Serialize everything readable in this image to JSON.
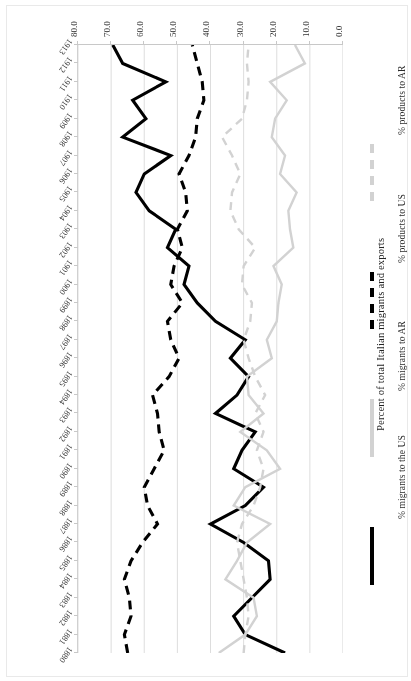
{
  "figure": {
    "rotation_note": "figure rendered upside-down in source screenshot",
    "background": "#ffffff"
  },
  "axes": {
    "value_axis_title": "Percent of total Italian migrants and exports",
    "value_ticks": [
      "0.0",
      "10.0",
      "20.0",
      "30.0",
      "40.0",
      "50.0",
      "60.0",
      "70.0",
      "80.0"
    ],
    "value_min": 0,
    "value_max": 80,
    "year_ticks": [
      "1880",
      "1881",
      "1882",
      "1883",
      "1884",
      "1885",
      "1886",
      "1887",
      "1888",
      "1889",
      "1890",
      "1891",
      "1892",
      "1893",
      "1894",
      "1895",
      "1896",
      "1897",
      "1898",
      "1899",
      "1900",
      "1901",
      "1902",
      "1903",
      "1904",
      "1905",
      "1906",
      "1907",
      "1908",
      "1909",
      "1910",
      "1911",
      "1912",
      "1913"
    ]
  },
  "legend": {
    "entries": [
      {
        "label": "% migrants to the US",
        "style": "solid-black",
        "color": "#000000"
      },
      {
        "label": "% migrants to AR",
        "style": "solid-gray",
        "color": "#d2d2d2"
      },
      {
        "label": "% products to US",
        "style": "dash-black",
        "color": "#000000"
      },
      {
        "label": "% products to AR",
        "style": "dash-gray",
        "color": "#d2d2d2"
      }
    ]
  },
  "chart_data": {
    "type": "line",
    "title": "",
    "xlabel": "",
    "ylabel": "Percent of total Italian migrants and exports",
    "ylim": [
      0,
      80
    ],
    "grid": true,
    "legend_position": "left",
    "orientation": "vertical-years",
    "x": [
      1880,
      1881,
      1882,
      1883,
      1884,
      1885,
      1886,
      1887,
      1888,
      1889,
      1890,
      1891,
      1892,
      1893,
      1894,
      1895,
      1896,
      1897,
      1898,
      1899,
      1900,
      1901,
      1902,
      1903,
      1904,
      1905,
      1906,
      1907,
      1908,
      1909,
      1910,
      1911,
      1912,
      1913
    ],
    "series": [
      {
        "name": "% migrants to the US",
        "color": "#000000",
        "dash": false,
        "values": [
          17.5,
          29.5,
          33.0,
          27.5,
          22.0,
          22.5,
          30.0,
          40.0,
          29.5,
          24.0,
          33.0,
          30.5,
          26.5,
          38.5,
          32.0,
          28.5,
          34.0,
          29.5,
          38.5,
          44.0,
          48.0,
          46.5,
          53.0,
          50.5,
          58.5,
          62.5,
          60.0,
          52.0,
          66.5,
          59.5,
          63.5,
          53.5,
          66.5,
          69.5
        ]
      },
      {
        "name": "% migrants to AR",
        "color": "#d2d2d2",
        "dash": false,
        "values": [
          37.5,
          29.5,
          26.0,
          27.0,
          35.5,
          32.0,
          29.0,
          22.0,
          33.0,
          29.5,
          19.0,
          23.0,
          31.0,
          24.0,
          28.5,
          29.0,
          21.5,
          23.0,
          20.0,
          19.5,
          18.5,
          21.0,
          15.0,
          16.0,
          16.5,
          14.0,
          19.0,
          17.5,
          21.5,
          20.5,
          17.0,
          22.0,
          11.5,
          14.5
        ]
      },
      {
        "name": "% products to US",
        "color": "#000000",
        "dash": true,
        "values": [
          65.0,
          66.0,
          64.0,
          64.5,
          66.0,
          64.0,
          60.5,
          56.0,
          59.0,
          60.0,
          57.0,
          54.0,
          55.5,
          56.0,
          57.5,
          52.5,
          49.5,
          52.0,
          53.0,
          48.5,
          52.0,
          51.0,
          48.5,
          50.0,
          47.0,
          47.5,
          49.5,
          46.5,
          44.5,
          44.0,
          42.0,
          42.5,
          44.0,
          45.5
        ]
      },
      {
        "name": "% products to AR",
        "color": "#d2d2d2",
        "dash": true,
        "values": [
          30.0,
          29.5,
          28.5,
          29.0,
          30.0,
          31.0,
          32.0,
          30.5,
          27.0,
          25.0,
          24.0,
          26.0,
          24.0,
          26.5,
          23.5,
          26.5,
          28.5,
          30.0,
          28.0,
          27.5,
          30.5,
          30.0,
          26.5,
          31.5,
          34.0,
          33.5,
          31.0,
          33.5,
          36.5,
          30.5,
          29.0,
          28.5,
          29.0,
          28.5
        ]
      }
    ]
  }
}
